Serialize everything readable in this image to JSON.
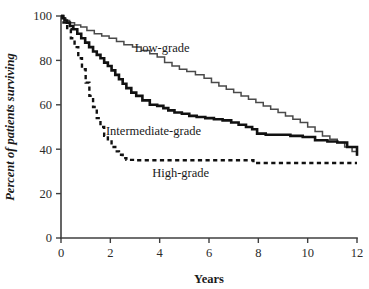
{
  "chart_data": {
    "type": "line",
    "title": "",
    "subtitle": "",
    "xlabel": "Years",
    "ylabel": "Percent of patients surviving",
    "xlim": [
      0,
      12
    ],
    "ylim": [
      0,
      100
    ],
    "xticks": [
      0,
      2,
      4,
      6,
      8,
      10,
      12
    ],
    "xtick_labels": [
      "0",
      "2",
      "4",
      "6",
      "8",
      "10",
      "12"
    ],
    "yticks": [
      0,
      20,
      40,
      60,
      80,
      100
    ],
    "ytick_labels": [
      "0",
      "20",
      "40",
      "60",
      "80",
      "100"
    ],
    "grid": false,
    "legend_position": "inline-annotations",
    "annotations": [
      {
        "text": "Low-grade",
        "x": 4.1,
        "y": 84
      },
      {
        "text": "Intermediate-grade",
        "x": 3.75,
        "y": 46.5
      },
      {
        "text": "High-grade",
        "x": 4.85,
        "y": 27.5
      }
    ],
    "series": [
      {
        "name": "Low-grade",
        "style": "solid-thin",
        "color": "#4a4a4a",
        "step": "post",
        "x": [
          0,
          0.08,
          0.2,
          0.35,
          0.55,
          0.8,
          1.05,
          1.35,
          1.65,
          1.95,
          2.25,
          2.55,
          2.9,
          3.25,
          3.6,
          3.9,
          4.2,
          4.5,
          4.8,
          5.1,
          5.45,
          5.8,
          6.1,
          6.4,
          6.7,
          7.0,
          7.3,
          7.6,
          7.9,
          8.2,
          8.5,
          8.8,
          9.1,
          9.4,
          9.7,
          10.0,
          10.3,
          10.6,
          10.9,
          11.2,
          11.5,
          11.8,
          12.0
        ],
        "y": [
          100,
          99,
          98,
          97,
          96,
          95,
          93.5,
          92,
          91,
          90,
          88.5,
          87,
          86,
          84.5,
          83,
          81.5,
          79,
          77.5,
          76,
          75,
          73.5,
          72,
          70,
          68.5,
          67,
          65.5,
          64,
          62.5,
          61,
          59.5,
          58,
          56.5,
          55,
          53.5,
          52,
          50,
          48,
          46,
          44.5,
          43,
          41,
          39,
          37
        ]
      },
      {
        "name": "Intermediate-grade",
        "style": "solid-thick",
        "color": "#111111",
        "step": "post",
        "x": [
          0,
          0.06,
          0.14,
          0.24,
          0.36,
          0.5,
          0.66,
          0.82,
          0.98,
          1.14,
          1.3,
          1.45,
          1.6,
          1.75,
          1.9,
          2.05,
          2.2,
          2.35,
          2.5,
          2.65,
          2.85,
          3.05,
          3.3,
          3.6,
          3.9,
          4.15,
          4.35,
          4.6,
          4.9,
          5.2,
          5.5,
          5.85,
          6.2,
          6.55,
          6.9,
          7.2,
          7.5,
          7.75,
          7.95,
          8.3,
          8.8,
          9.3,
          9.8,
          10.3,
          10.8,
          11.2,
          11.6,
          12.0
        ],
        "y": [
          100,
          99,
          98,
          97,
          95.5,
          94,
          92,
          90,
          88,
          86,
          84,
          82.5,
          81,
          79,
          77.5,
          75.5,
          73.5,
          71.5,
          69.5,
          67.5,
          65.5,
          64,
          62,
          60,
          59.5,
          58.5,
          57.5,
          56.5,
          56,
          55,
          54.5,
          54,
          53.5,
          53,
          52,
          51,
          50,
          49,
          47,
          46.5,
          46.5,
          46,
          45.5,
          44,
          43.5,
          43,
          41,
          37
        ]
      },
      {
        "name": "High-grade",
        "style": "dashed",
        "color": "#111111",
        "step": "post",
        "x": [
          0,
          0.1,
          0.25,
          0.4,
          0.55,
          0.7,
          0.85,
          1.0,
          1.15,
          1.3,
          1.45,
          1.6,
          1.75,
          1.9,
          2.05,
          2.2,
          2.35,
          2.5,
          2.65,
          3.0,
          4.0,
          5.0,
          6.0,
          7.0,
          7.6,
          7.8,
          9.0,
          10.5,
          12.0
        ],
        "y": [
          100,
          97,
          94,
          90,
          86,
          81,
          76,
          70,
          64,
          59,
          54,
          50,
          46,
          43.5,
          41,
          39,
          37.5,
          36,
          35.2,
          35,
          35,
          35,
          35,
          35,
          35,
          33.8,
          33.8,
          33.8,
          33.8
        ]
      }
    ]
  },
  "axes": {
    "x_title": "Years",
    "y_title": "Percent of patients surviving"
  }
}
